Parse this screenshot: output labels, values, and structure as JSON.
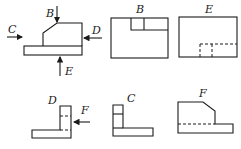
{
  "labels": {
    "main": {
      "B": "B",
      "C": "C",
      "D": "D",
      "E": "E"
    },
    "view_b": "B",
    "view_e": "E",
    "view_d": "D",
    "view_d_arrow": "F",
    "view_c": "C",
    "view_f": "F"
  },
  "colors": {
    "line": "#1a1a1a",
    "background": "#ffffff"
  }
}
